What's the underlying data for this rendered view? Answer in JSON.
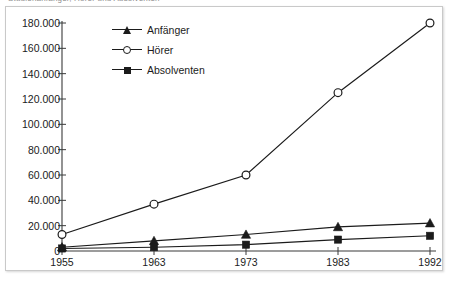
{
  "caption_sliver": "Studienanfänger, Hörer und Absolventen",
  "legend": {
    "position": "inside-top-left",
    "items": [
      {
        "label": "Anfänger",
        "marker": "triangle-marker-icon"
      },
      {
        "label": "Hörer",
        "marker": "circle-marker-icon"
      },
      {
        "label": "Absolventen",
        "marker": "square-marker-icon"
      }
    ]
  },
  "chart_data": {
    "type": "line",
    "title": "",
    "subtitle": "",
    "xlabel": "",
    "ylabel": "",
    "categories": [
      "1955",
      "1963",
      "1973",
      "1983",
      "1992"
    ],
    "x_tick_labels": [
      "1955",
      "1963",
      "1973",
      "1983",
      "1992"
    ],
    "y_tick_labels": [
      "0",
      "20.000",
      "40.000",
      "60.000",
      "80.000",
      "100.000",
      "120.000",
      "140.000",
      "160.000",
      "180.000"
    ],
    "y_tick_values": [
      0,
      20000,
      40000,
      60000,
      80000,
      100000,
      120000,
      140000,
      160000,
      180000
    ],
    "ylim": [
      0,
      180000
    ],
    "grid": false,
    "legend_position": "inside-top-left",
    "number_format": "de-DE",
    "series": [
      {
        "name": "Anfänger",
        "marker": "triangle",
        "color": "#1b1b1b",
        "values": [
          3000,
          8000,
          13000,
          19000,
          22000
        ]
      },
      {
        "name": "Hörer",
        "marker": "circle-open",
        "color": "#1b1b1b",
        "values": [
          13000,
          37000,
          60000,
          125000,
          180000
        ]
      },
      {
        "name": "Absolventen",
        "marker": "square",
        "color": "#1b1b1b",
        "values": [
          2000,
          3000,
          5000,
          9000,
          12000
        ]
      }
    ]
  },
  "colors": {
    "ink": "#1b1b1b",
    "axis": "#3a3a3a",
    "frame_border": "#c9c9c9",
    "background": "#ffffff"
  }
}
